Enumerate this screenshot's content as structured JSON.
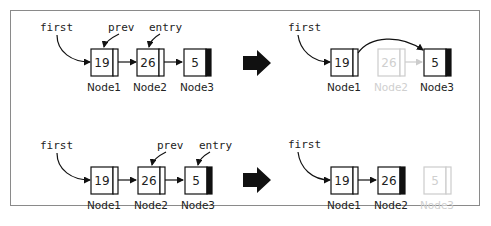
{
  "diagram": {
    "colors": {
      "ink": "#111111",
      "ghost": "#cccccc",
      "frame": "#8a8a8a"
    },
    "transition_arrow_icon": "right-arrow-icon",
    "rows": [
      {
        "name": "delete-middle-node",
        "before": {
          "pointers": [
            {
              "label": "first",
              "target": "Node1"
            },
            {
              "label": "prev",
              "target": "Node1"
            },
            {
              "label": "entry",
              "target": "Node2"
            }
          ],
          "nodes": [
            {
              "id": "Node1",
              "value": "19",
              "is_last": false,
              "ghost": false
            },
            {
              "id": "Node2",
              "value": "26",
              "is_last": false,
              "ghost": false
            },
            {
              "id": "Node3",
              "value": "5",
              "is_last": true,
              "ghost": false
            }
          ]
        },
        "after": {
          "pointers": [
            {
              "label": "first",
              "target": "Node1"
            }
          ],
          "nodes": [
            {
              "id": "Node1",
              "value": "19",
              "is_last": false,
              "ghost": false
            },
            {
              "id": "Node2",
              "value": "26",
              "is_last": false,
              "ghost": true
            },
            {
              "id": "Node3",
              "value": "5",
              "is_last": true,
              "ghost": false
            }
          ],
          "bypass_link": {
            "from": "Node1",
            "to": "Node3"
          }
        }
      },
      {
        "name": "delete-last-node",
        "before": {
          "pointers": [
            {
              "label": "first",
              "target": "Node1"
            },
            {
              "label": "prev",
              "target": "Node2"
            },
            {
              "label": "entry",
              "target": "Node3"
            }
          ],
          "nodes": [
            {
              "id": "Node1",
              "value": "19",
              "is_last": false,
              "ghost": false
            },
            {
              "id": "Node2",
              "value": "26",
              "is_last": false,
              "ghost": false
            },
            {
              "id": "Node3",
              "value": "5",
              "is_last": true,
              "ghost": false
            }
          ]
        },
        "after": {
          "pointers": [
            {
              "label": "first",
              "target": "Node1"
            }
          ],
          "nodes": [
            {
              "id": "Node1",
              "value": "19",
              "is_last": false,
              "ghost": false
            },
            {
              "id": "Node2",
              "value": "26",
              "is_last": true,
              "ghost": false
            },
            {
              "id": "Node3",
              "value": "5",
              "is_last": false,
              "ghost": true
            }
          ]
        }
      }
    ]
  }
}
